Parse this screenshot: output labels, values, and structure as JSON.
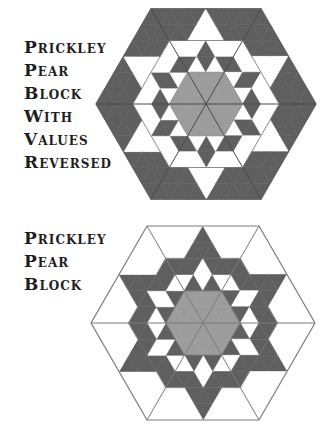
{
  "colors": {
    "dark": "#5f5f5f",
    "light": "#9c9c9c",
    "white": "#ffffff",
    "line": "#7a7a7a",
    "text": "#1e1e1e"
  },
  "figures": [
    {
      "id": "reversed",
      "title_lines": [
        "Prickley",
        "Pear",
        "Block",
        "With",
        "Values",
        "Reversed"
      ],
      "center": [
        206,
        104
      ],
      "radius": 110,
      "outline": false,
      "wedge_rows": [
        "G",
        "GGG",
        "DWDWD",
        "WWWDWWW",
        "DDDWWWDDD",
        "DDDDDWDDDDD"
      ]
    },
    {
      "id": "normal",
      "title_lines": [
        "Prickley",
        "Pear",
        "Block"
      ],
      "center": [
        203,
        323
      ],
      "radius": 112,
      "outline": true,
      "wedge_rows": [
        "G",
        "GGG",
        "WDWDW",
        "DDDWDDD",
        "WWWDDDWWW",
        "WWWWWDWWWWW"
      ]
    }
  ]
}
